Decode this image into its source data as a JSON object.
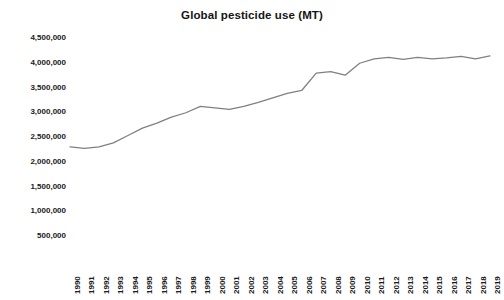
{
  "chart": {
    "title": "Global pesticide use (MT)"
  },
  "chart_data": {
    "type": "line",
    "title": "Global pesticide use (MT)",
    "xlabel": "",
    "ylabel": "",
    "ylim": [
      0,
      4500000
    ],
    "ytick_step": 500000,
    "grid": false,
    "legend": false,
    "line_color": "#808080",
    "x": [
      "1990",
      "1991",
      "1992",
      "1993",
      "1994",
      "1995",
      "1996",
      "1997",
      "1998",
      "1999",
      "2000",
      "2001",
      "2002",
      "2003",
      "2004",
      "2005",
      "2006",
      "2007",
      "2008",
      "2009",
      "2010",
      "2011",
      "2012",
      "2013",
      "2014",
      "2015",
      "2016",
      "2017",
      "2018",
      "2019"
    ],
    "ytick_labels": [
      "500,000",
      "1,000,000",
      "1,500,000",
      "2,000,000",
      "2,500,000",
      "3,000,000",
      "3,500,000",
      "4,000,000",
      "4,500,000"
    ],
    "ytick_values": [
      500000,
      1000000,
      1500000,
      2000000,
      2500000,
      3000000,
      3500000,
      4000000,
      4500000
    ],
    "series": [
      {
        "name": "Global pesticide use",
        "values": [
          2300000,
          2270000,
          2300000,
          2380000,
          2530000,
          2680000,
          2780000,
          2900000,
          2990000,
          3120000,
          3090000,
          3060000,
          3120000,
          3200000,
          3290000,
          3380000,
          3440000,
          3790000,
          3820000,
          3750000,
          3990000,
          4080000,
          4110000,
          4070000,
          4110000,
          4080000,
          4100000,
          4130000,
          4080000,
          4140000
        ]
      }
    ]
  }
}
